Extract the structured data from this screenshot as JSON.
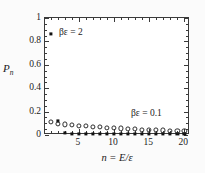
{
  "figure": {
    "background": "#fbfbfb",
    "frame_color": "#3a3a3a",
    "marker_color": "#111111"
  },
  "axes": {
    "y_title": "P",
    "y_title_sub": "n",
    "x_title": "n = E/ε",
    "y_ticklabels": [
      "0",
      "0.2",
      "0.4",
      "0.6",
      "0.8",
      "1"
    ],
    "y_tickvalues": [
      0,
      0.2,
      0.4,
      0.6,
      0.8,
      1
    ],
    "x_ticklabels": [
      "5",
      "10",
      "15",
      "20"
    ],
    "x_tickvalues": [
      5,
      10,
      15,
      20
    ]
  },
  "annotations": {
    "hot": "βε = 2",
    "cold": "βε = 0.1"
  },
  "chart_data": {
    "type": "scatter",
    "title": "",
    "xlabel": "n = E/ε",
    "ylabel": "P_n",
    "xlim": [
      0.2,
      20.8
    ],
    "ylim": [
      0,
      1
    ],
    "grid": false,
    "legend": "in-plot annotations",
    "x": [
      1,
      2,
      3,
      4,
      5,
      6,
      7,
      8,
      9,
      10,
      11,
      12,
      13,
      14,
      15,
      16,
      17,
      18,
      19,
      20
    ],
    "series": [
      {
        "name": "βε = 2",
        "marker": "filled-square",
        "values": [
          0.865,
          0.117,
          0.016,
          0.012,
          0.01,
          0.01,
          0.01,
          0.01,
          0.01,
          0.01,
          0.01,
          0.01,
          0.01,
          0.01,
          0.01,
          0.01,
          0.01,
          0.01,
          0.01,
          0.01
        ]
      },
      {
        "name": "βε = 0.1",
        "marker": "open-circle",
        "values": [
          0.112,
          0.098,
          0.09,
          0.085,
          0.08,
          0.076,
          0.072,
          0.068,
          0.064,
          0.06,
          0.056,
          0.052,
          0.049,
          0.046,
          0.043,
          0.041,
          0.039,
          0.037,
          0.035,
          0.033
        ]
      }
    ]
  }
}
